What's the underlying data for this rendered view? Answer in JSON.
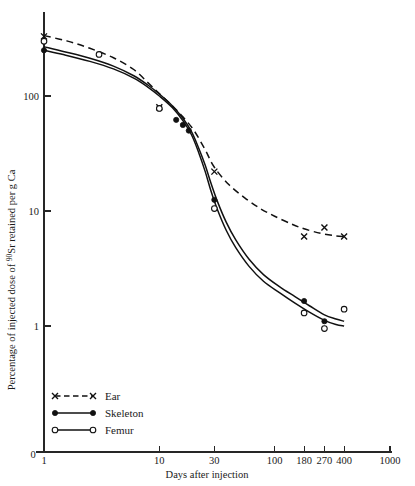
{
  "chart_data": {
    "type": "line",
    "title": "",
    "xlabel": "Days after injection",
    "ylabel": "Percentage of injected dose of 90Sr retained per g Ca",
    "ylabel_prefix": "Percentage of injected dose of ",
    "ylabel_superscript": "90",
    "ylabel_suffix": "Sr retained per g Ca",
    "xscale": "log",
    "yscale": "log",
    "xlim": [
      1,
      1000
    ],
    "ylim": [
      1,
      400
    ],
    "grid": false,
    "origin_label": "0",
    "xticks": [
      1,
      10,
      30,
      100,
      180,
      270,
      400,
      1000
    ],
    "xticklabels": [
      "1",
      "10",
      "30",
      "100",
      "180",
      "270",
      "400",
      "1000"
    ],
    "yticks": [
      1,
      10,
      100
    ],
    "yticklabels": [
      "1",
      "10",
      "100"
    ],
    "legend_position": "lower-left",
    "series": [
      {
        "name": "Ear",
        "marker": "cross",
        "linestyle": "dashed",
        "color": "#111111",
        "x": [
          1,
          10,
          30,
          180,
          270,
          400
        ],
        "y": [
          330,
          80,
          22,
          6.0,
          7.2,
          6.0
        ]
      },
      {
        "name": "Skeleton",
        "marker": "filled-circle",
        "linestyle": "solid",
        "color": "#111111",
        "x": [
          1,
          10,
          14,
          16,
          18,
          30,
          180,
          270
        ],
        "y": [
          250,
          78,
          62,
          56,
          50,
          12.5,
          1.65,
          1.1
        ]
      },
      {
        "name": "Femur",
        "marker": "open-circle",
        "linestyle": "solid",
        "color": "#111111",
        "x": [
          1,
          3,
          10,
          30,
          180,
          270,
          400
        ],
        "y": [
          300,
          230,
          78,
          10.5,
          1.3,
          0.95,
          1.4
        ]
      }
    ],
    "curves": [
      {
        "name": "Ear",
        "linestyle": "dashed",
        "points": [
          [
            1,
            335
          ],
          [
            1.6,
            300
          ],
          [
            2.5,
            260
          ],
          [
            4,
            215
          ],
          [
            6,
            170
          ],
          [
            8,
            130
          ],
          [
            10,
            105
          ],
          [
            13,
            82
          ],
          [
            16,
            66
          ],
          [
            20,
            50
          ],
          [
            25,
            34
          ],
          [
            30,
            24
          ],
          [
            40,
            17
          ],
          [
            55,
            13
          ],
          [
            75,
            10.5
          ],
          [
            100,
            9.0
          ],
          [
            140,
            7.7
          ],
          [
            180,
            7.0
          ],
          [
            250,
            6.4
          ],
          [
            330,
            6.1
          ],
          [
            400,
            6.0
          ]
        ]
      },
      {
        "name": "Skeleton",
        "linestyle": "solid",
        "points": [
          [
            1,
            268
          ],
          [
            1.5,
            243
          ],
          [
            2.5,
            213
          ],
          [
            4,
            182
          ],
          [
            6,
            150
          ],
          [
            8,
            124
          ],
          [
            10,
            104
          ],
          [
            13,
            82
          ],
          [
            16,
            64
          ],
          [
            19,
            49
          ],
          [
            22,
            35
          ],
          [
            25,
            25
          ],
          [
            28,
            17.5
          ],
          [
            32,
            12.0
          ],
          [
            38,
            8.0
          ],
          [
            46,
            5.6
          ],
          [
            60,
            3.8
          ],
          [
            80,
            2.8
          ],
          [
            110,
            2.2
          ],
          [
            150,
            1.8
          ],
          [
            200,
            1.5
          ],
          [
            270,
            1.25
          ],
          [
            340,
            1.15
          ],
          [
            400,
            1.1
          ]
        ]
      },
      {
        "name": "Femur",
        "linestyle": "solid",
        "points": [
          [
            1,
            250
          ],
          [
            1.5,
            228
          ],
          [
            2.5,
            200
          ],
          [
            4,
            172
          ],
          [
            6,
            143
          ],
          [
            8,
            119
          ],
          [
            10,
            100
          ],
          [
            13,
            79
          ],
          [
            16,
            61
          ],
          [
            19,
            46
          ],
          [
            22,
            32
          ],
          [
            25,
            22
          ],
          [
            28,
            15.0
          ],
          [
            32,
            10.2
          ],
          [
            38,
            6.8
          ],
          [
            46,
            4.8
          ],
          [
            60,
            3.3
          ],
          [
            80,
            2.45
          ],
          [
            110,
            1.95
          ],
          [
            150,
            1.58
          ],
          [
            200,
            1.32
          ],
          [
            270,
            1.12
          ],
          [
            340,
            1.03
          ],
          [
            400,
            1.0
          ]
        ]
      }
    ]
  },
  "legend": {
    "items": [
      {
        "label": "Ear",
        "style": "dashed",
        "marker": "cross"
      },
      {
        "label": "Skeleton",
        "style": "solid",
        "marker": "filled-circle"
      },
      {
        "label": "Femur",
        "style": "solid",
        "marker": "open-circle"
      }
    ]
  }
}
